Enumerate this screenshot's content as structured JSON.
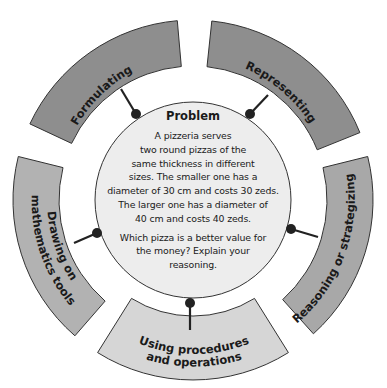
{
  "problem": {
    "title": "Problem",
    "paragraph1_lines": [
      "A pizzeria serves",
      "two round pizzas of the",
      "same thickness in different",
      "sizes. The smaller one has a",
      "diameter of 30 cm and costs 30 zeds.",
      "The larger one has a diameter of",
      "40 cm and costs 40 zeds."
    ],
    "paragraph2_lines": [
      "Which pizza is a better value for",
      "the money? Explain your",
      "reasoning."
    ]
  },
  "segments": [
    {
      "id": "formulating",
      "label_lines": [
        "Formulating"
      ],
      "color": "#8e8e8e"
    },
    {
      "id": "representing",
      "label_lines": [
        "Representing"
      ],
      "color": "#8e8e8e"
    },
    {
      "id": "reasoning",
      "label_lines": [
        "Reasoning or strategizing"
      ],
      "color": "#a8a8a8"
    },
    {
      "id": "using-procedures",
      "label_lines": [
        "Using procedures",
        "and operations"
      ],
      "color": "#d6d6d6"
    },
    {
      "id": "drawing-tools",
      "label_lines": [
        "Drawing on",
        "mathematics tools"
      ],
      "color": "#b2b2b2"
    }
  ],
  "colors": {
    "center_fill": "#ededed",
    "outline": "#333333",
    "connector": "#222222"
  }
}
